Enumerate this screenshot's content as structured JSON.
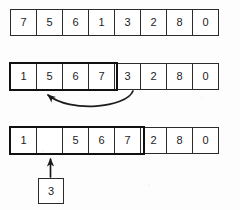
{
  "diagram": {
    "colors": {
      "ink": "#1c1c1c",
      "border": "#2b2b2b",
      "bold_border": "#111111",
      "background": "#fdfdfd"
    },
    "rows": [
      {
        "id": "row-initial",
        "cells": [
          "7",
          "5",
          "6",
          "1",
          "3",
          "2",
          "8",
          "0"
        ],
        "highlight_count": 0
      },
      {
        "id": "row-middle",
        "cells": [
          "1",
          "5",
          "6",
          "7",
          "3",
          "2",
          "8",
          "0"
        ],
        "highlight_count": 4
      },
      {
        "id": "row-shifted",
        "cells": [
          "1",
          "",
          "5",
          "6",
          "7",
          "2",
          "8",
          "0"
        ],
        "highlight_count": 5
      }
    ],
    "annotations": {
      "curved_arrow": {
        "name": "insert-move-arrow",
        "from_cell_index": 4,
        "to_cell_index": 1,
        "label": ""
      },
      "up_arrow": {
        "name": "insert-value-arrow",
        "target_cell_index": 1,
        "label": ""
      },
      "held_value_box": {
        "name": "held-value-box",
        "value": "3"
      }
    }
  }
}
